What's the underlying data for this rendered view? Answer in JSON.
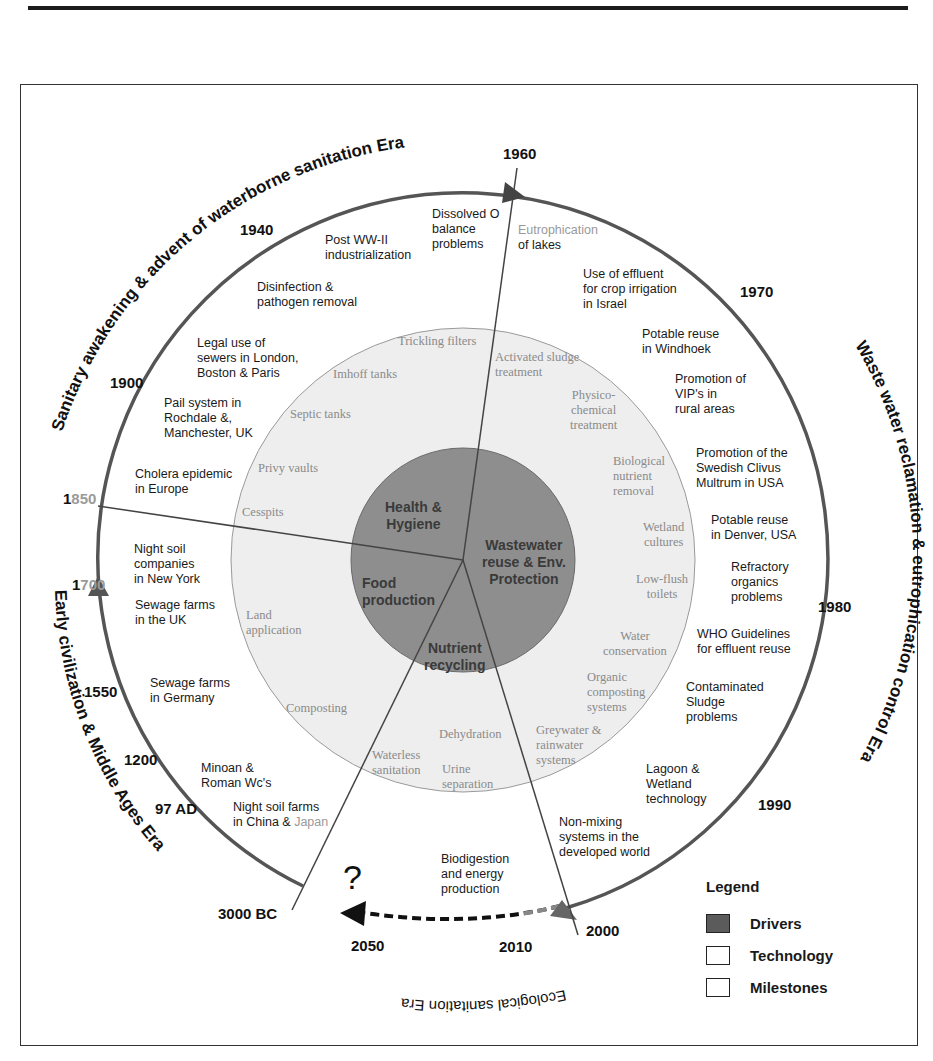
{
  "figure": {
    "center": {
      "x": 463,
      "y": 560
    },
    "colors": {
      "drivers_fill": "#8e8e8e",
      "technology_fill": "#eeeeee",
      "milestone_fill": "#ffffff",
      "ring_stroke": "#555555",
      "text_dark": "#1a1a1a",
      "tech_text": "#8a8a8a"
    }
  },
  "eras": {
    "top_left": "Sanitary awakening & advent of waterborne sanitation Era",
    "right": "Waste water reclamation & eutrophication control Era",
    "bottom": "Ecological sanitation Era",
    "left": "Early civilization & Middle Ages Era"
  },
  "years": {
    "y1960": "1960",
    "y1940": "1940",
    "y1970": "1970",
    "y1900": "1900",
    "y1850_a": "1",
    "y1850_b": "850",
    "y1700_a": "1",
    "y1700_b": "700",
    "y1550": "1550",
    "y1200": "1200",
    "y97ad": "97 AD",
    "y3000bc": "3000 BC",
    "y1980": "1980",
    "y1990": "1990",
    "y2000": "2000",
    "y2010": "2010",
    "y2050": "2050"
  },
  "future_marker": "?",
  "drivers": {
    "health": [
      "Health &",
      "Hygiene"
    ],
    "wastewater": [
      "Wastewater",
      "reuse & Env.",
      "Protection"
    ],
    "food": [
      "Food",
      "production"
    ],
    "nutrient": [
      "Nutrient",
      "recycling"
    ]
  },
  "technology": {
    "trickling": [
      "Trickling filters"
    ],
    "imhoff": [
      "Imhoff tanks"
    ],
    "septic": [
      "Septic tanks"
    ],
    "privy": [
      "Privy vaults"
    ],
    "cesspits": [
      "Cesspits"
    ],
    "activated": [
      "Activated sludge",
      "treatment"
    ],
    "physico": [
      "Physico-",
      "chemical",
      "treatment"
    ],
    "biological": [
      "Biological",
      "nutrient",
      "removal"
    ],
    "wetland": [
      "Wetland",
      "cultures"
    ],
    "lowflush": [
      "Low-flush",
      "toilets"
    ],
    "water_cons": [
      "Water",
      "conservation"
    ],
    "organic": [
      "Organic",
      "composting",
      "systems"
    ],
    "greywater": [
      "Greywater &",
      "rainwater",
      "systems"
    ],
    "dehydration": [
      "Dehydration"
    ],
    "urine": [
      "Urine",
      "separation"
    ],
    "waterless": [
      "Waterless",
      "sanitation"
    ],
    "composting": [
      "Composting"
    ],
    "land": [
      "Land",
      "application"
    ]
  },
  "milestones": {
    "dissolved": [
      "Dissolved O",
      "balance",
      "problems"
    ],
    "eutro_a": "Eutrophication",
    "eutro_b": "of lakes",
    "postww": [
      "Post WW-II",
      "industrialization"
    ],
    "disinfection": [
      "Disinfection &",
      "pathogen removal"
    ],
    "legal": [
      "Legal use of",
      "sewers in London,",
      "Boston & Paris"
    ],
    "pail": [
      "Pail system in",
      "Rochdale &,",
      "Manchester, UK"
    ],
    "cholera": [
      "Cholera epidemic",
      "in Europe"
    ],
    "nightsoil_ny": [
      "Night soil",
      "companies",
      "in New York"
    ],
    "sewage_uk": [
      "Sewage farms",
      "in the UK"
    ],
    "sewage_de": [
      "Sewage farms",
      "in Germany"
    ],
    "minoan": [
      "Minoan &",
      "Roman Wc's"
    ],
    "nightsoil_cn_a": "Night soil farms",
    "nightsoil_cn_b": "in China & ",
    "nightsoil_cn_c": "Japan",
    "effluent_israel": [
      "Use of effluent",
      "for crop irrigation",
      "in Israel"
    ],
    "windhoek": [
      "Potable reuse",
      "in Windhoek"
    ],
    "vip": [
      "Promotion of",
      "VIP's in",
      "rural areas"
    ],
    "clivus": [
      "Promotion of the",
      "Swedish Clivus",
      "Multrum in USA"
    ],
    "denver": [
      "Potable reuse",
      "in Denver, USA"
    ],
    "refractory": [
      "Refractory",
      "organics",
      "problems"
    ],
    "who": [
      "WHO Guidelines",
      "for effluent reuse"
    ],
    "sludge": [
      "Contaminated",
      "Sludge",
      "problems"
    ],
    "lagoon": [
      "Lagoon &",
      "Wetland",
      "technology"
    ],
    "nonmixing": [
      "Non-mixing",
      "systems in the",
      "developed world"
    ],
    "biodigestion": [
      "Biodigestion",
      "and energy",
      "production"
    ]
  },
  "legend": {
    "title": "Legend",
    "items": [
      {
        "label": "Drivers",
        "swatch": "drivers"
      },
      {
        "label": "Technology",
        "swatch": "technology"
      },
      {
        "label": "Milestones",
        "swatch": "milestones"
      }
    ]
  }
}
